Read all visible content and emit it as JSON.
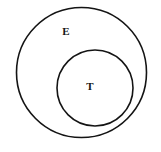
{
  "figure": {
    "type": "euler-venn-diagram",
    "title": "",
    "background_color": "#ffffff",
    "stroke_color": "#141414",
    "width": 161,
    "height": 152
  },
  "sets": [
    {
      "id": "outer",
      "label": "E",
      "role": "universal-set",
      "shape": "circle",
      "center_x": 81.5,
      "center_y": 72.5,
      "radius": 65,
      "stroke_color": "#141414",
      "stroke_width": 1.6,
      "fill": "none",
      "label_x": 66,
      "label_y": 32
    },
    {
      "id": "inner",
      "label": "T",
      "role": "subset",
      "shape": "circle",
      "center_x": 95,
      "center_y": 88,
      "radius": 38,
      "stroke_color": "#141414",
      "stroke_width": 1.6,
      "fill": "none",
      "label_x": 90,
      "label_y": 87
    }
  ],
  "relation": "T is a subset of E"
}
